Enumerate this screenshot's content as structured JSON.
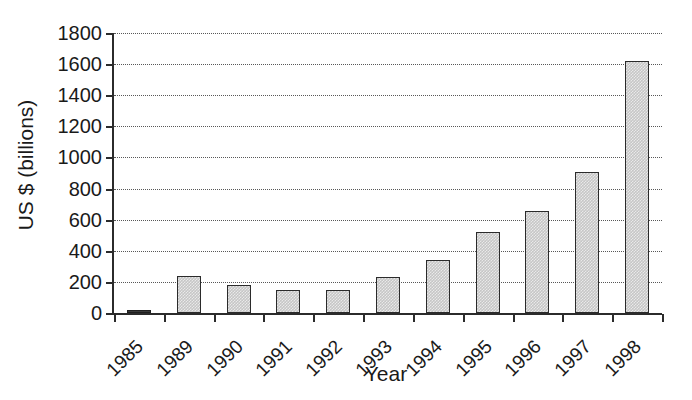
{
  "chart_data": {
    "type": "bar",
    "title": "",
    "xlabel": "Year",
    "ylabel": "US $ (billions)",
    "categories": [
      "1985",
      "1989",
      "1990",
      "1991",
      "1992",
      "1993",
      "1994",
      "1995",
      "1996",
      "1997",
      "1998"
    ],
    "values": [
      10,
      240,
      180,
      145,
      150,
      232,
      340,
      522,
      655,
      905,
      1620
    ],
    "ylim": [
      0,
      1800
    ],
    "yticks": [
      0,
      200,
      400,
      600,
      800,
      1000,
      1200,
      1400,
      1600,
      1800
    ],
    "ytick_labels": [
      "0",
      "200",
      "400",
      "600",
      "800",
      "1000",
      "1200",
      "1400",
      "1600",
      "1800"
    ],
    "grid": "horizontal-dotted",
    "legend": "none",
    "bar_fill_color": "#c6c6c6",
    "bar_border_color": "#2b2b2b",
    "axis_color": "#2b2b2b",
    "gridline_color": "#585858",
    "background_color": "#ffffff"
  }
}
